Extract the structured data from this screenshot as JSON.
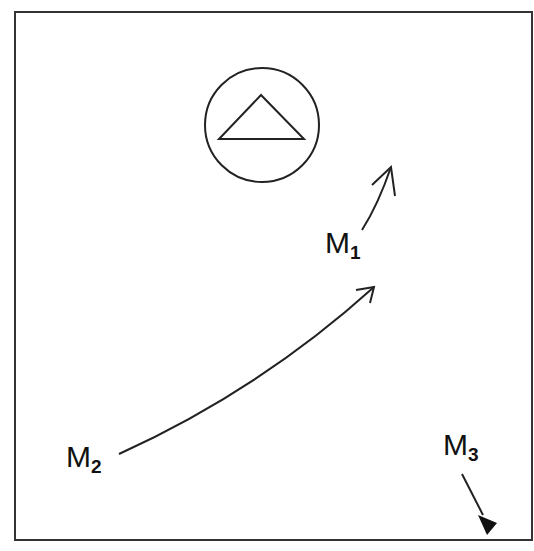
{
  "diagram": {
    "frame": {
      "x": 15,
      "y": 12,
      "width": 517,
      "height": 528,
      "stroke": "#333333"
    },
    "landmark": {
      "shape": "circle-with-triangle",
      "circle": {
        "cx": 262,
        "cy": 125,
        "r": 57
      },
      "triangle": {
        "apex": [
          261,
          95
        ],
        "base_left": [
          219,
          139
        ],
        "base_right": [
          304,
          139
        ]
      }
    },
    "labels": [
      {
        "id": "M1",
        "letter": "M",
        "sub": "1",
        "x": 325,
        "y": 228
      },
      {
        "id": "M2",
        "letter": "M",
        "sub": "2",
        "x": 66,
        "y": 442
      },
      {
        "id": "M3",
        "letter": "M",
        "sub": "3",
        "x": 443,
        "y": 430
      }
    ],
    "arrows": [
      {
        "id": "M1-arrow",
        "style": "open-head",
        "path": "M362 230 Q378 205 391 167"
      },
      {
        "id": "M2-arrow",
        "style": "open-head",
        "path": "M119 454 Q260 390 374 287"
      },
      {
        "id": "M3-arrow",
        "style": "filled-head",
        "path": "M462 474 L488 526"
      }
    ],
    "ink_color": "#222222"
  }
}
